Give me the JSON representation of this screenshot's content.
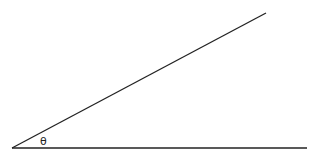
{
  "diagram": {
    "type": "angle",
    "vertex": {
      "x": 12,
      "y": 148
    },
    "baseline_end": {
      "x": 307,
      "y": 148
    },
    "ray_end": {
      "x": 266,
      "y": 13
    },
    "angle_label": "θ",
    "line_color": "#222222"
  }
}
